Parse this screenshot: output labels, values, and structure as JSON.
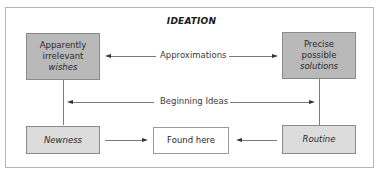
{
  "diagram": {
    "title": "IDEATION",
    "boxes": {
      "top_left": {
        "line1": "Apparently",
        "line2": "irrelevant",
        "line3": "wishes"
      },
      "top_right": {
        "line1": "Precise",
        "line2": "possible",
        "line3": "solutions"
      },
      "bottom_left": {
        "label": "Newness"
      },
      "bottom_center": {
        "label": "Found here"
      },
      "bottom_right": {
        "label": "Routine"
      }
    },
    "connectors": {
      "approximations": "Approximations",
      "beginning_ideas": "Beginning Ideas"
    },
    "colors": {
      "dark_box": "#b9b9b9",
      "light_box": "#dcdcdc",
      "white_box": "#ffffff",
      "border": "#8a8a8a"
    }
  }
}
